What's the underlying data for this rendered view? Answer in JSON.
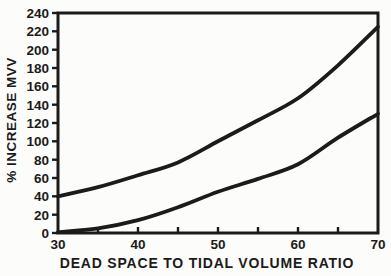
{
  "colors": {
    "ink": "#1b1b1b",
    "paper": "#fcfcfa"
  },
  "chart_data": {
    "type": "line",
    "title": "",
    "xlabel": "DEAD SPACE TO TIDAL VOLUME RATIO",
    "ylabel": "% INCREASE MVV",
    "xlim": [
      30,
      70
    ],
    "ylim": [
      0,
      240
    ],
    "grid": false,
    "legend": "none",
    "x_ticks_minor": [
      35,
      40,
      45,
      50,
      55,
      60,
      65
    ],
    "x_labeled_ticks": [
      30,
      40,
      50,
      60,
      70
    ],
    "y_ticks": [
      0,
      20,
      40,
      60,
      80,
      100,
      120,
      140,
      160,
      180,
      200,
      220,
      240
    ],
    "x": [
      30,
      35,
      40,
      45,
      50,
      55,
      60,
      65,
      70
    ],
    "series": [
      {
        "name": "upper-curve",
        "values": [
          40,
          50,
          63,
          77,
          100,
          123,
          147,
          183,
          225
        ]
      },
      {
        "name": "lower-curve",
        "values": [
          1,
          5,
          14,
          28,
          45,
          59,
          75,
          104,
          130
        ]
      }
    ]
  }
}
